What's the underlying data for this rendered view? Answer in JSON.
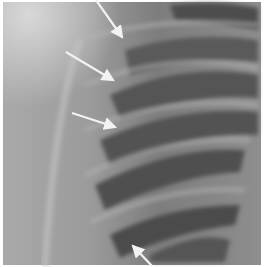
{
  "image": {
    "kind": "chest radiograph (rib cage, right upper hemithorax)",
    "width": 265,
    "height": 267,
    "border_color": "#ffffff",
    "background_color": "#8a8a8a",
    "arrows": [
      {
        "id": 1,
        "from": [
          96,
          0
        ],
        "to": [
          124,
          40
        ],
        "color": "#f0f0f0"
      },
      {
        "id": 2,
        "from": [
          66,
          52
        ],
        "to": [
          116,
          82
        ],
        "color": "#f0f0f0"
      },
      {
        "id": 3,
        "from": [
          72,
          113
        ],
        "to": [
          118,
          128
        ],
        "color": "#f0f0f0"
      },
      {
        "id": 4,
        "from": [
          152,
          267
        ],
        "to": [
          131,
          243
        ],
        "color": "#f0f0f0"
      }
    ],
    "annotation_count": "4"
  }
}
